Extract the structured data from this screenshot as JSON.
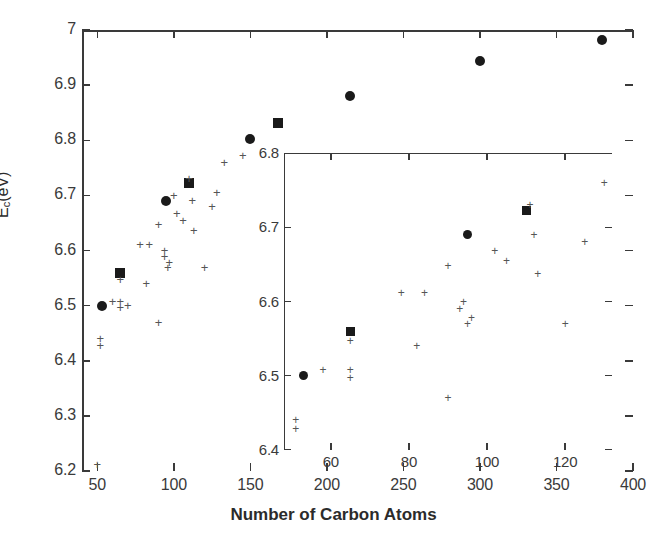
{
  "chart_data": {
    "type": "scatter",
    "title": "",
    "xlabel": "Number of Carbon Atoms",
    "ylabel": "E_c(eV)",
    "ylabel_base": "E",
    "ylabel_sub": "c",
    "ylabel_unit": "(eV)",
    "xlim": [
      40,
      400
    ],
    "ylim": [
      6.2,
      7.0
    ],
    "grid": false,
    "legend": "none",
    "xticks": [
      50,
      100,
      150,
      200,
      250,
      300,
      350,
      400
    ],
    "xtick_labels": [
      "50",
      "100",
      "150",
      "200",
      "250",
      "300",
      "350",
      "400"
    ],
    "yticks": [
      6.2,
      6.3,
      6.4,
      6.5,
      6.6,
      6.7,
      6.8,
      6.9,
      7.0
    ],
    "ytick_labels": [
      "6.2",
      "6.3",
      "6.4",
      "6.5",
      "6.6",
      "6.7",
      "6.8",
      "6.9",
      "7"
    ],
    "series": [
      {
        "name": "filled-circles",
        "marker": "circle",
        "color": "#1a1a1a",
        "points": [
          [
            53,
            6.5
          ],
          [
            95,
            6.69
          ],
          [
            150,
            6.803
          ],
          [
            215,
            6.881
          ],
          [
            300,
            6.944
          ],
          [
            380,
            6.981
          ]
        ]
      },
      {
        "name": "filled-squares",
        "marker": "square",
        "color": "#1a1a1a",
        "points": [
          [
            65,
            6.56
          ],
          [
            110,
            6.722
          ],
          [
            168,
            6.831
          ]
        ]
      },
      {
        "name": "plus-markers",
        "marker": "plus",
        "color": "#555555",
        "points": [
          [
            50,
            6.212
          ],
          [
            52,
            6.44
          ],
          [
            52,
            6.428
          ],
          [
            60,
            6.508
          ],
          [
            65,
            6.547
          ],
          [
            65,
            6.508
          ],
          [
            65,
            6.497
          ],
          [
            70,
            6.5
          ],
          [
            78,
            6.611
          ],
          [
            82,
            6.54
          ],
          [
            84,
            6.611
          ],
          [
            90,
            6.47
          ],
          [
            90,
            6.648
          ],
          [
            94,
            6.59
          ],
          [
            94,
            6.6
          ],
          [
            96,
            6.57
          ],
          [
            97,
            6.578
          ],
          [
            100,
            6.7
          ],
          [
            102,
            6.668
          ],
          [
            106,
            6.655
          ],
          [
            110,
            6.73
          ],
          [
            112,
            6.69
          ],
          [
            113,
            6.637
          ],
          [
            120,
            6.57
          ],
          [
            125,
            6.68
          ],
          [
            128,
            6.705
          ],
          [
            133,
            6.76
          ],
          [
            145,
            6.772
          ]
        ]
      }
    ],
    "inset": {
      "type": "scatter",
      "xlim": [
        48,
        132
      ],
      "ylim": [
        6.4,
        6.8
      ],
      "xticks": [
        60,
        80,
        100,
        120
      ],
      "xtick_labels": [
        "60",
        "80",
        "100",
        "120"
      ],
      "yticks": [
        6.4,
        6.5,
        6.6,
        6.7,
        6.8
      ],
      "ytick_labels": [
        "6.4",
        "6.5",
        "6.6",
        "6.7",
        "6.8"
      ],
      "grid": false,
      "series": [
        {
          "name": "filled-circles",
          "marker": "circle",
          "color": "#1a1a1a",
          "points": [
            [
              53,
              6.5
            ],
            [
              95,
              6.69
            ]
          ]
        },
        {
          "name": "filled-squares",
          "marker": "square",
          "color": "#1a1a1a",
          "points": [
            [
              65,
              6.56
            ],
            [
              110,
              6.722
            ]
          ]
        },
        {
          "name": "plus-markers",
          "marker": "plus",
          "color": "#555555",
          "points": [
            [
              51,
              6.44
            ],
            [
              51,
              6.428
            ],
            [
              58,
              6.508
            ],
            [
              65,
              6.547
            ],
            [
              65,
              6.508
            ],
            [
              65,
              6.497
            ],
            [
              78,
              6.611
            ],
            [
              82,
              6.54
            ],
            [
              84,
              6.611
            ],
            [
              90,
              6.47
            ],
            [
              90,
              6.648
            ],
            [
              93,
              6.59
            ],
            [
              94,
              6.6
            ],
            [
              95,
              6.57
            ],
            [
              96,
              6.578
            ],
            [
              102,
              6.668
            ],
            [
              105,
              6.655
            ],
            [
              111,
              6.73
            ],
            [
              112,
              6.69
            ],
            [
              113,
              6.637
            ],
            [
              120,
              6.57
            ],
            [
              125,
              6.68
            ],
            [
              130,
              6.76
            ]
          ]
        }
      ]
    }
  }
}
